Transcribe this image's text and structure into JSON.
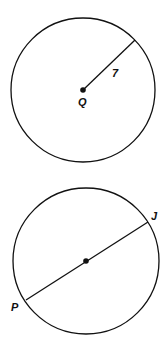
{
  "diagrams": [
    {
      "name": "circle-Q",
      "center_label": "Q",
      "radius_label": "7",
      "center": [
        83,
        90
      ],
      "radius": 72,
      "segment_end": [
        135,
        40
      ]
    },
    {
      "name": "circle-diameter-PJ",
      "endpoint_labels": [
        "J",
        "P"
      ],
      "center": [
        86,
        261
      ],
      "radius": 73,
      "J": [
        148,
        222
      ],
      "P": [
        26,
        300
      ]
    }
  ],
  "colors": {
    "stroke": "#111111",
    "background": "#ffffff"
  }
}
